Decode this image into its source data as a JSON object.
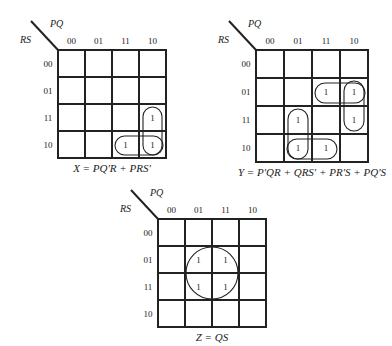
{
  "diagram": {
    "column_variable": "PQ",
    "row_variable": "RS",
    "column_headers": [
      "00",
      "01",
      "11",
      "10"
    ],
    "row_headers": [
      "00",
      "01",
      "11",
      "10"
    ],
    "maps": [
      {
        "id": "X",
        "origin": [
          58,
          50
        ],
        "cell": 27,
        "equation": "X = PQ′R + PRS′",
        "ones": [
          [
            2,
            3
          ],
          [
            3,
            2
          ],
          [
            3,
            3
          ]
        ],
        "groups": [
          {
            "term": "PQ′R",
            "shape": "vertical",
            "rows": [
              2,
              3
            ],
            "col": 3
          },
          {
            "term": "PRS′",
            "shape": "horizontal",
            "row": 3,
            "cols": [
              2,
              3
            ]
          }
        ]
      },
      {
        "id": "Y",
        "origin": [
          256,
          50
        ],
        "cell": 28,
        "equation": "Y = P′QR + QRS′ + PR′S + PQ′S",
        "ones": [
          [
            1,
            2
          ],
          [
            1,
            3
          ],
          [
            2,
            1
          ],
          [
            2,
            3
          ],
          [
            3,
            1
          ],
          [
            3,
            2
          ]
        ],
        "groups": [
          {
            "term": "P′QR",
            "shape": "vertical",
            "rows": [
              2,
              3
            ],
            "col": 1
          },
          {
            "term": "QRS′",
            "shape": "horizontal",
            "row": 3,
            "cols": [
              1,
              2
            ]
          },
          {
            "term": "PR′S",
            "shape": "horizontal",
            "row": 1,
            "cols": [
              2,
              3
            ]
          },
          {
            "term": "PQ′S",
            "shape": "vertical",
            "rows": [
              1,
              2
            ],
            "col": 3
          }
        ]
      },
      {
        "id": "Z",
        "origin": [
          158,
          219
        ],
        "cell": 27,
        "equation": "Z = QS",
        "ones": [
          [
            1,
            1
          ],
          [
            1,
            2
          ],
          [
            2,
            1
          ],
          [
            2,
            2
          ]
        ],
        "groups": [
          {
            "term": "QS",
            "shape": "circle",
            "rows": [
              1,
              2
            ],
            "cols": [
              1,
              2
            ]
          }
        ]
      }
    ]
  }
}
